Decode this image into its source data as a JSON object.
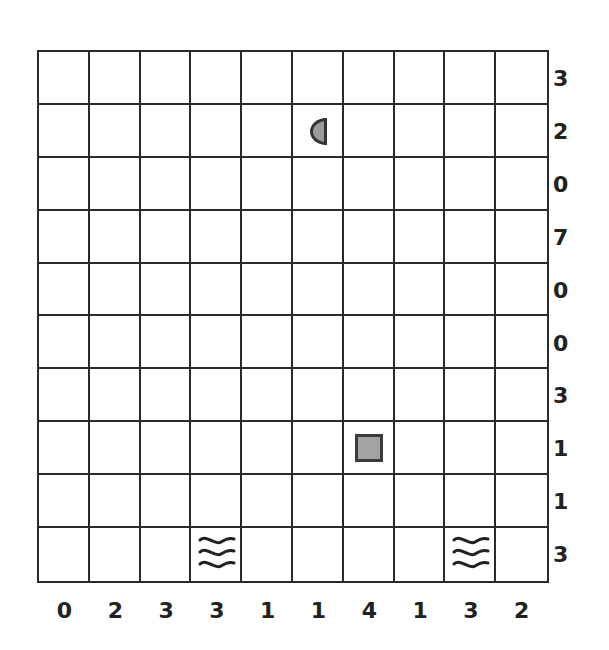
{
  "puzzle": {
    "type": "battleship",
    "rows": 10,
    "cols": 10,
    "row_clues": [
      "3",
      "2",
      "0",
      "7",
      "0",
      "0",
      "3",
      "1",
      "1",
      "3"
    ],
    "col_clues": [
      "0",
      "2",
      "3",
      "3",
      "1",
      "1",
      "4",
      "1",
      "3",
      "2"
    ],
    "given_cells": [
      {
        "row": 1,
        "col": 5,
        "piece": "ship-end-left"
      },
      {
        "row": 7,
        "col": 6,
        "piece": "ship-middle-square"
      },
      {
        "row": 9,
        "col": 3,
        "piece": "water"
      },
      {
        "row": 9,
        "col": 8,
        "piece": "water"
      }
    ]
  },
  "colors": {
    "grid_line": "#2a2a2a",
    "ship_fill": "#9a9a9a",
    "ship_border": "#333333",
    "clue_text": "#222222",
    "background": "#ffffff"
  }
}
